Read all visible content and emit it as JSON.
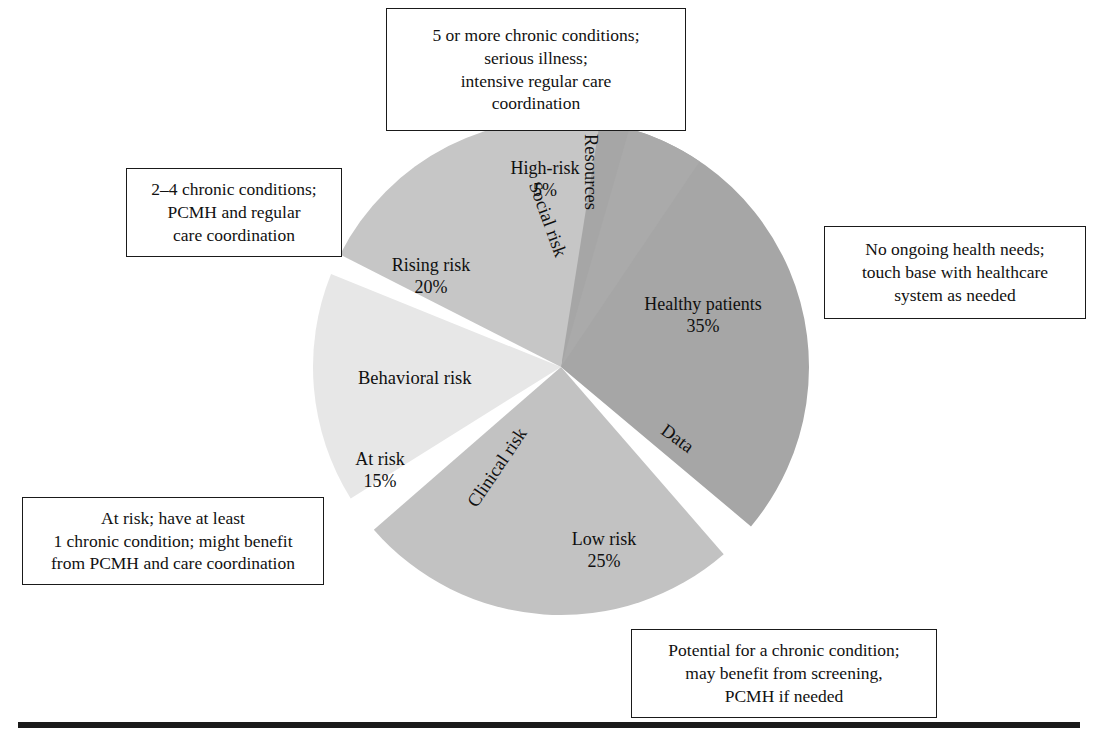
{
  "figure": {
    "background": "#ffffff"
  },
  "chart_data": {
    "type": "pie",
    "xlabel": "",
    "ylabel": "",
    "legend_position": "none",
    "grid": false,
    "categories": [
      "Healthy patients",
      "Low risk",
      "At risk",
      "Rising risk",
      "High-risk"
    ],
    "values": [
      35,
      25,
      15,
      20,
      5
    ],
    "value_suffix": "%",
    "colors": [
      "#a6a6a6",
      "#c2c2c2",
      "#e7e7e7",
      "#c6c6c6",
      "#aaaaaa"
    ],
    "slices": [
      {
        "name": "Healthy patients",
        "label": "Healthy patients",
        "percent_label": "35%",
        "value": 35,
        "color": "#a6a6a6",
        "start_angle_deg": 4,
        "end_angle_deg": 130,
        "callout": [
          "No ongoing health needs;",
          "touch base with healthcare",
          "system as needed"
        ]
      },
      {
        "name": "Low risk",
        "label": "Low risk",
        "percent_label": "25%",
        "value": 25,
        "color": "#c2c2c2",
        "start_angle_deg": 139,
        "end_angle_deg": 229,
        "callout": [
          "Potential for a chronic condition;",
          "may benefit from screening,",
          "PCMH if needed"
        ]
      },
      {
        "name": "At risk",
        "label": "At risk",
        "percent_label": "15%",
        "value": 15,
        "color": "#e7e7e7",
        "start_angle_deg": 238,
        "end_angle_deg": 292,
        "callout": [
          "At risk; have at least",
          "1 chronic condition; might benefit",
          "from PCMH and care coordination"
        ]
      },
      {
        "name": "Rising risk",
        "label": "Rising risk",
        "percent_label": "20%",
        "value": 20,
        "color": "#c6c6c6",
        "start_angle_deg": 297,
        "end_angle_deg": 369,
        "callout": [
          "2–4 chronic conditions;",
          "PCMH and regular",
          "care coordination"
        ]
      },
      {
        "name": "High-risk",
        "label": "High-risk",
        "percent_label": "5%",
        "value": 5,
        "color": "#aaaaaa",
        "start_angle_deg": 376,
        "end_angle_deg": 394,
        "callout": [
          "5 or more chronic conditions;",
          "serious illness;",
          "intensive regular care",
          "coordination"
        ]
      }
    ],
    "gap_labels": [
      {
        "name": "Resources",
        "text": "Resources",
        "rotation_deg": 90
      },
      {
        "name": "Data",
        "text": "Data",
        "rotation_deg": 35
      },
      {
        "name": "Clinical risk",
        "text": "Clinical risk",
        "rotation_deg": -55
      },
      {
        "name": "Behavioral risk",
        "text": "Behavioral risk",
        "rotation_deg": 0
      },
      {
        "name": "Social risk",
        "text": "Social risk",
        "rotation_deg": 70
      }
    ]
  },
  "callouts": {
    "high_risk": {
      "lines": [
        "5 or more chronic conditions;",
        "serious illness;",
        "intensive regular care",
        "coordination"
      ]
    },
    "rising_risk": {
      "lines": [
        "2–4 chronic conditions;",
        "PCMH and regular",
        "care coordination"
      ]
    },
    "healthy": {
      "lines": [
        "No ongoing health needs;",
        "touch base with healthcare",
        "system as needed"
      ]
    },
    "at_risk": {
      "lines": [
        "At risk; have at least",
        "1 chronic condition; might benefit",
        "from PCMH and care coordination"
      ]
    },
    "low_risk": {
      "lines": [
        "Potential for a chronic condition;",
        "may benefit from screening,",
        "PCMH if needed"
      ]
    }
  },
  "slice_labels": {
    "healthy": {
      "name": "Healthy patients",
      "pct": "35%"
    },
    "low_risk": {
      "name": "Low risk",
      "pct": "25%"
    },
    "at_risk": {
      "name": "At risk",
      "pct": "15%"
    },
    "rising_risk": {
      "name": "Rising risk",
      "pct": "20%"
    },
    "high_risk": {
      "name": "High-risk",
      "pct": "5%"
    }
  },
  "gap_labels": {
    "resources": "Resources",
    "data": "Data",
    "clinical_risk": "Clinical risk",
    "behavioral_risk": "Behavioral risk",
    "social_risk": "Social risk"
  }
}
